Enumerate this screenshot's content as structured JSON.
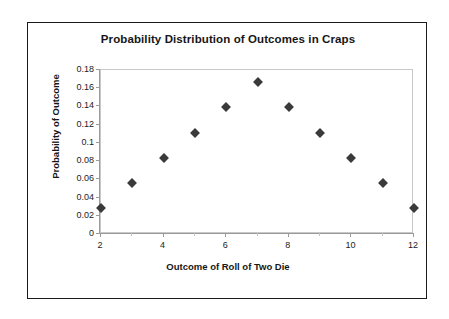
{
  "chart_data": {
    "type": "scatter",
    "title": "Probability Distribution of Outcomes in Craps",
    "xlabel": "Outcome of Roll of Two Die",
    "ylabel": "Probability of Outcome",
    "x": [
      2,
      3,
      4,
      5,
      6,
      7,
      8,
      9,
      10,
      11,
      12
    ],
    "values": [
      0.028,
      0.056,
      0.083,
      0.111,
      0.139,
      0.167,
      0.139,
      0.111,
      0.083,
      0.056,
      0.028
    ],
    "xlim": [
      2,
      12
    ],
    "ylim": [
      0,
      0.18
    ],
    "xticks": [
      "2",
      "4",
      "6",
      "8",
      "10",
      "12"
    ],
    "xtick_values": [
      2,
      4,
      6,
      8,
      10,
      12
    ],
    "yticks": [
      "0",
      "0.02",
      "0.04",
      "0.06",
      "0.08",
      "0.1",
      "0.12",
      "0.14",
      "0.16",
      "0.18"
    ],
    "ytick_values": [
      0,
      0.02,
      0.04,
      0.06,
      0.08,
      0.1,
      0.12,
      0.14,
      0.16,
      0.18
    ],
    "grid": false,
    "legend": false,
    "marker": "diamond",
    "marker_color": "#3a3a3a",
    "frame_color": "#1b1b1b",
    "plot_border_color": "#c8c8c8",
    "background": "#ffffff"
  }
}
